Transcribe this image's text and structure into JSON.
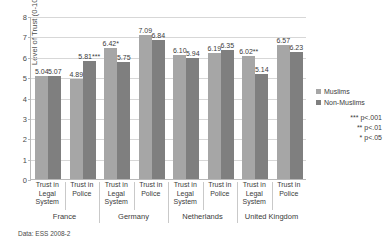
{
  "chart_data": {
    "type": "bar",
    "title": "",
    "xlabel": "",
    "ylabel": "Level of Trust (0-10)",
    "ylim": [
      0,
      8
    ],
    "yticks": [
      "0",
      "1",
      "2",
      "3",
      "4",
      "5",
      "6",
      "7",
      "8"
    ],
    "grid": true,
    "legend_position": "right",
    "categories": [
      "Trust in Legal System",
      "Trust in Police",
      "Trust in Legal System",
      "Trust in Police",
      "Trust in Legal System",
      "Trust in Police",
      "Trust in Legal System",
      "Trust in Police"
    ],
    "category_lines": [
      [
        "Trust in",
        "Legal",
        "System"
      ],
      [
        "Trust in",
        "Police"
      ],
      [
        "Trust in",
        "Legal",
        "System"
      ],
      [
        "Trust in",
        "Police"
      ],
      [
        "Trust in",
        "Legal",
        "System"
      ],
      [
        "Trust in",
        "Police"
      ],
      [
        "Trust in",
        "Legal",
        "System"
      ],
      [
        "Trust in",
        "Police"
      ]
    ],
    "groups": [
      {
        "name": "France",
        "span": 2
      },
      {
        "name": "Germany",
        "span": 2
      },
      {
        "name": "Netherlands",
        "span": 2
      },
      {
        "name": "United Kingdom",
        "span": 2
      }
    ],
    "series": [
      {
        "name": "Muslims",
        "color": "#a6a6a6",
        "values": [
          5.04,
          4.89,
          6.42,
          7.09,
          6.1,
          6.19,
          6.02,
          6.57
        ],
        "labels": [
          "5.04",
          "4.89",
          "6.42*",
          "7.09",
          "6.10",
          "6.19",
          "6.02**",
          "6.57"
        ]
      },
      {
        "name": "Non-Muslims",
        "color": "#7f7f7f",
        "values": [
          5.07,
          5.81,
          5.75,
          6.84,
          5.94,
          6.35,
          5.14,
          6.23
        ],
        "labels": [
          "5.07",
          "5.81***",
          "5.75",
          "6.84",
          "5.94",
          "6.35",
          "5.14",
          "6.23"
        ]
      }
    ],
    "annotations": [
      "*** p<.001",
      "** p<.01",
      "* p<.05"
    ]
  },
  "legend": {
    "items": [
      {
        "label": "Muslims"
      },
      {
        "label": "Non-Muslims"
      }
    ]
  },
  "significance": {
    "lines": [
      "*** p<.001",
      "** p<.01",
      "* p<.05"
    ]
  },
  "footer": {
    "source": "Data: ESS 2008-2"
  },
  "title_sliver": {
    "text": ""
  }
}
